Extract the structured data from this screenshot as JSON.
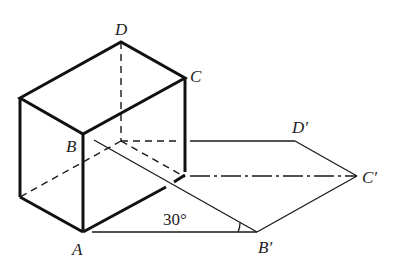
{
  "figure": {
    "labels": {
      "A": "A",
      "B": "B",
      "C": "C",
      "D": "D",
      "B_prime": "B′",
      "C_prime": "C′",
      "D_prime": "D′"
    },
    "angle_label": "30°",
    "colors": {
      "line": "#1a1a1a",
      "background": "#ffffff"
    }
  }
}
